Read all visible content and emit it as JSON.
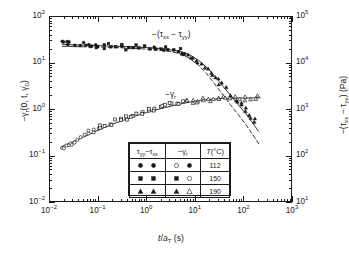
{
  "chart_data": {
    "type": "scatter",
    "title": "",
    "xlabel": "t/a_T (s)",
    "ylabel_left": "-γ_r(0, t, γ̇_0)",
    "ylabel_right": "-(τ_xx - τ_yy) (Pa)",
    "xscale": "log",
    "yscale": "log",
    "xlim": [
      0.01,
      1000
    ],
    "ylim_left": [
      0.01,
      100
    ],
    "ylim_right": [
      10,
      100000
    ],
    "grid": false,
    "legend_position": "inside-bottom-center",
    "xticks": [
      "10⁻²",
      "10⁻¹",
      "10⁰",
      "10¹",
      "10²",
      "10³"
    ],
    "yticks_left": [
      "10⁻²",
      "10⁻¹",
      "10⁰",
      "10¹",
      "10²"
    ],
    "yticks_right": [
      "10¹",
      "10²",
      "10³",
      "10⁴",
      "10⁵"
    ],
    "annotations": [
      {
        "text": "-(τ_xx - τ_yy)",
        "x": 6.0,
        "y": 45.0
      },
      {
        "text": "-γ_r",
        "x": 9.0,
        "y": 2.6
      }
    ],
    "series": [
      {
        "name": "-(τ_xx - τ_yy), 112 °C",
        "marker": "circle-filled",
        "points": [
          [
            0.018,
            29.0
          ],
          [
            0.02,
            26.5
          ],
          [
            0.022,
            28.0
          ],
          [
            0.026,
            27.0
          ],
          [
            0.034,
            24.0
          ],
          [
            0.045,
            23.5
          ],
          [
            0.055,
            26.0
          ],
          [
            0.062,
            25.0
          ],
          [
            0.075,
            24.5
          ],
          [
            0.09,
            23.0
          ]
        ]
      },
      {
        "name": "-(τ_xx - τ_yy), 150 °C",
        "marker": "square-filled",
        "points": [
          [
            0.1,
            24.5
          ],
          [
            0.14,
            23.0
          ],
          [
            0.18,
            24.0
          ],
          [
            0.24,
            22.5
          ],
          [
            0.32,
            23.5
          ],
          [
            0.42,
            21.5
          ],
          [
            0.55,
            22.5
          ],
          [
            0.72,
            21.0
          ],
          [
            0.95,
            22.0
          ],
          [
            1.25,
            20.0
          ],
          [
            1.6,
            21.0
          ],
          [
            2.1,
            19.5
          ],
          [
            2.8,
            20.5
          ],
          [
            3.6,
            18.5
          ],
          [
            4.7,
            18.0
          ],
          [
            6.2,
            16.5
          ]
        ]
      },
      {
        "name": "-(τ_xx - τ_yy), 190 °C",
        "marker": "triangle-filled",
        "points": [
          [
            5.5,
            17.0
          ],
          [
            7.0,
            15.0
          ],
          [
            9.0,
            13.0
          ],
          [
            11.5,
            11.0
          ],
          [
            14.0,
            9.0
          ],
          [
            18.0,
            7.5
          ],
          [
            22.0,
            6.0
          ],
          [
            28.0,
            4.6
          ],
          [
            35.0,
            3.6
          ],
          [
            45.0,
            2.8
          ],
          [
            58.0,
            2.1
          ],
          [
            72.0,
            1.6
          ],
          [
            90.0,
            1.25
          ],
          [
            115.0,
            0.95
          ],
          [
            140.0,
            0.72
          ],
          [
            170.0,
            0.55
          ]
        ]
      },
      {
        "name": "-γ_r, 112 °C",
        "marker": "circle-open",
        "points": [
          [
            0.018,
            0.14
          ],
          [
            0.02,
            0.15
          ],
          [
            0.024,
            0.16
          ],
          [
            0.028,
            0.18
          ],
          [
            0.034,
            0.2
          ],
          [
            0.042,
            0.23
          ],
          [
            0.052,
            0.26
          ],
          [
            0.064,
            0.3
          ],
          [
            0.08,
            0.34
          ],
          [
            0.098,
            0.38
          ]
        ]
      },
      {
        "name": "-γ_r, 150 °C",
        "marker": "square-open",
        "points": [
          [
            0.11,
            0.41
          ],
          [
            0.14,
            0.45
          ],
          [
            0.18,
            0.5
          ],
          [
            0.23,
            0.55
          ],
          [
            0.3,
            0.6
          ],
          [
            0.38,
            0.66
          ],
          [
            0.5,
            0.72
          ],
          [
            0.65,
            0.79
          ],
          [
            0.85,
            0.86
          ],
          [
            1.1,
            0.93
          ],
          [
            1.45,
            1.0
          ],
          [
            1.9,
            1.08
          ],
          [
            2.5,
            1.16
          ],
          [
            3.2,
            1.24
          ],
          [
            4.2,
            1.32
          ],
          [
            5.5,
            1.4
          ]
        ]
      },
      {
        "name": "-γ_r, 190 °C",
        "marker": "triangle-open",
        "points": [
          [
            7.0,
            1.47
          ],
          [
            9.0,
            1.53
          ],
          [
            11.5,
            1.58
          ],
          [
            15.0,
            1.62
          ],
          [
            19.0,
            1.65
          ],
          [
            25.0,
            1.68
          ],
          [
            32.0,
            1.7
          ],
          [
            42.0,
            1.71
          ],
          [
            55.0,
            1.72
          ],
          [
            70.0,
            1.72
          ],
          [
            90.0,
            1.73
          ],
          [
            115.0,
            1.73
          ],
          [
            150.0,
            1.74
          ],
          [
            190.0,
            1.74
          ]
        ]
      }
    ],
    "curves": [
      {
        "name": "model-solid-upper",
        "style": "solid",
        "points": [
          [
            0.018,
            25.5
          ],
          [
            0.05,
            24.5
          ],
          [
            0.15,
            23.5
          ],
          [
            0.5,
            22.5
          ],
          [
            1.5,
            21.0
          ],
          [
            3.0,
            19.5
          ],
          [
            5.0,
            18.0
          ],
          [
            8.0,
            15.0
          ],
          [
            12.0,
            11.5
          ],
          [
            18.0,
            8.0
          ],
          [
            26.0,
            5.2
          ],
          [
            38.0,
            3.2
          ],
          [
            55.0,
            2.0
          ],
          [
            80.0,
            1.25
          ],
          [
            115.0,
            0.8
          ],
          [
            160.0,
            0.5
          ],
          [
            210.0,
            0.33
          ]
        ]
      },
      {
        "name": "model-dashed-upper",
        "style": "dashed",
        "points": [
          [
            0.018,
            23.0
          ],
          [
            0.05,
            22.5
          ],
          [
            0.15,
            22.0
          ],
          [
            0.5,
            21.0
          ],
          [
            1.5,
            19.5
          ],
          [
            3.0,
            18.0
          ],
          [
            5.0,
            16.0
          ],
          [
            8.0,
            12.5
          ],
          [
            12.0,
            9.0
          ],
          [
            18.0,
            5.8
          ],
          [
            26.0,
            3.5
          ],
          [
            38.0,
            2.1
          ],
          [
            55.0,
            1.25
          ],
          [
            80.0,
            0.76
          ],
          [
            115.0,
            0.46
          ],
          [
            160.0,
            0.28
          ],
          [
            215.0,
            0.175
          ]
        ]
      },
      {
        "name": "model-solid-lower",
        "style": "solid",
        "points": [
          [
            0.018,
            0.155
          ],
          [
            0.04,
            0.22
          ],
          [
            0.09,
            0.33
          ],
          [
            0.2,
            0.47
          ],
          [
            0.45,
            0.64
          ],
          [
            1.0,
            0.84
          ],
          [
            2.2,
            1.05
          ],
          [
            5.0,
            1.28
          ],
          [
            10.0,
            1.48
          ],
          [
            20.0,
            1.62
          ],
          [
            40.0,
            1.7
          ],
          [
            80.0,
            1.73
          ],
          [
            160.0,
            1.74
          ],
          [
            230.0,
            1.74
          ]
        ]
      }
    ]
  },
  "legend": {
    "headers": {
      "col1": "τ_yy − τ_xx",
      "col2": "−γ_r",
      "col3": "T(°C)"
    },
    "rows": [
      {
        "temp": "112",
        "stress_markers": [
          "circle-filled",
          "circle-half"
        ],
        "gamma_markers": [
          "circle-open",
          "circle-dotted"
        ]
      },
      {
        "temp": "150",
        "stress_markers": [
          "square-filled",
          "square-filled"
        ],
        "gamma_markers": [
          "square-filled",
          "circle-open"
        ]
      },
      {
        "temp": "190",
        "stress_markers": [
          "triangle-filled",
          "triangle-filled"
        ],
        "gamma_markers": [
          "triangle-filled",
          "triangle-open"
        ]
      }
    ]
  },
  "axes": {
    "x_title_main": "t/a",
    "x_title_sub": "T",
    "x_title_unit": " (s)",
    "y_left_title": "−γ",
    "y_left_sub": "r",
    "y_left_rest": "(0, t, γ̇",
    "y_left_sub2": "0",
    "y_left_end": ")",
    "y_right_title": "−(τ",
    "y_right_sub1": "xx",
    "y_right_mid": " − τ",
    "y_right_sub2": "yy",
    "y_right_end": ") (Pa)"
  },
  "annotations_text": {
    "upper": "−(τ",
    "upper_sub1": "xx",
    "upper_mid": " − τ",
    "upper_sub2": "yy",
    "upper_end": ")",
    "lower": "−γ",
    "lower_sub": "r"
  },
  "tick_labels": {
    "x": [
      {
        "base": "10",
        "exp": "−2"
      },
      {
        "base": "10",
        "exp": "−1"
      },
      {
        "base": "10",
        "exp": "0"
      },
      {
        "base": "10",
        "exp": "1"
      },
      {
        "base": "10",
        "exp": "2"
      },
      {
        "base": "10",
        "exp": "3"
      }
    ],
    "y_left": [
      {
        "base": "10",
        "exp": "2"
      },
      {
        "base": "10",
        "exp": "1"
      },
      {
        "base": "10",
        "exp": "0"
      },
      {
        "base": "10",
        "exp": "−1"
      },
      {
        "base": "10",
        "exp": "−2"
      }
    ],
    "y_right": [
      {
        "base": "10",
        "exp": "5"
      },
      {
        "base": "10",
        "exp": "4"
      },
      {
        "base": "10",
        "exp": "3"
      },
      {
        "base": "10",
        "exp": "2"
      },
      {
        "base": "10",
        "exp": "1"
      }
    ]
  },
  "colors": {
    "ink": "#1a1a1a",
    "background": "#ffffff"
  }
}
